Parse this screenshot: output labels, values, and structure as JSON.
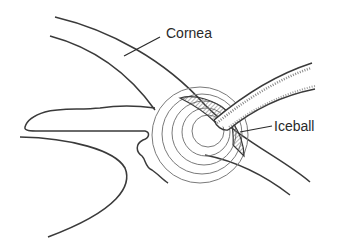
{
  "figure": {
    "type": "anatomical line illustration",
    "colors": {
      "background": "#ffffff",
      "line": "#3a3a3a",
      "ring": "#7a7a7a",
      "text": "#2a2a2a"
    }
  },
  "labels": {
    "cornea": "Cornea",
    "iceball": "Iceball"
  }
}
